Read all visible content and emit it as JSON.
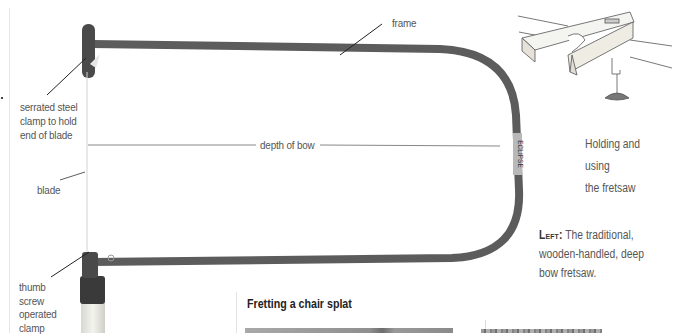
{
  "diagram": {
    "labels": {
      "frame": "frame",
      "clamp_top": [
        "serrated steel",
        "clamp to hold",
        "end of blade"
      ],
      "depth": "depth of bow",
      "blade": "blade",
      "clamp_bottom": [
        "thumb",
        "screw",
        "operated",
        "clamp"
      ],
      "brand_stamp": "ECLIPSE"
    }
  },
  "inset": {
    "caption_lines": [
      "Holding and using",
      "the fretsaw"
    ]
  },
  "main_caption": {
    "lead": "Left:",
    "lines": [
      " The traditional,",
      "wooden-handled, deep",
      "bow fretsaw."
    ]
  },
  "section": {
    "title": "Fretting a chair splat"
  },
  "colors": {
    "frame": "#5a5a5a",
    "text": "#555555",
    "heading": "#222222"
  }
}
